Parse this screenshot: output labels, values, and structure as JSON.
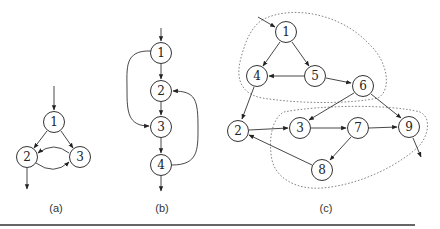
{
  "figure": {
    "captions": {
      "a": "(a)",
      "b": "(b)",
      "c": "(c)"
    },
    "graph_a": {
      "nodes": [
        {
          "id": "1",
          "label": "1",
          "x": 54,
          "y": 122
        },
        {
          "id": "2",
          "label": "2",
          "x": 27,
          "y": 157
        },
        {
          "id": "3",
          "label": "3",
          "x": 80,
          "y": 157
        }
      ],
      "edges": [
        {
          "from": "entry",
          "to": "1"
        },
        {
          "from": "1",
          "to": "2"
        },
        {
          "from": "1",
          "to": "3"
        },
        {
          "from": "2",
          "to": "3"
        },
        {
          "from": "3",
          "to": "2"
        },
        {
          "from": "2",
          "to": "exit"
        }
      ]
    },
    "graph_b": {
      "nodes": [
        {
          "id": "1",
          "label": "1",
          "x": 161,
          "y": 53
        },
        {
          "id": "2",
          "label": "2",
          "x": 161,
          "y": 91
        },
        {
          "id": "3",
          "label": "3",
          "x": 161,
          "y": 127
        },
        {
          "id": "4",
          "label": "4",
          "x": 161,
          "y": 165
        }
      ],
      "edges": [
        {
          "from": "entry",
          "to": "1"
        },
        {
          "from": "1",
          "to": "2"
        },
        {
          "from": "2",
          "to": "3"
        },
        {
          "from": "3",
          "to": "4"
        },
        {
          "from": "1",
          "to": "3"
        },
        {
          "from": "4",
          "to": "2"
        },
        {
          "from": "4",
          "to": "exit"
        }
      ]
    },
    "graph_c": {
      "nodes": [
        {
          "id": "1",
          "label": "1",
          "x": 286,
          "y": 32
        },
        {
          "id": "4",
          "label": "4",
          "x": 257,
          "y": 76
        },
        {
          "id": "5",
          "label": "5",
          "x": 315,
          "y": 76
        },
        {
          "id": "6",
          "label": "6",
          "x": 363,
          "y": 86
        },
        {
          "id": "2",
          "label": "2",
          "x": 238,
          "y": 131
        },
        {
          "id": "3",
          "label": "3",
          "x": 300,
          "y": 128
        },
        {
          "id": "7",
          "label": "7",
          "x": 358,
          "y": 128
        },
        {
          "id": "9",
          "label": "9",
          "x": 409,
          "y": 127
        },
        {
          "id": "8",
          "label": "8",
          "x": 322,
          "y": 170
        }
      ],
      "edges": [
        {
          "from": "entry",
          "to": "1"
        },
        {
          "from": "1",
          "to": "4"
        },
        {
          "from": "1",
          "to": "5"
        },
        {
          "from": "5",
          "to": "4"
        },
        {
          "from": "5",
          "to": "6"
        },
        {
          "from": "4",
          "to": "2"
        },
        {
          "from": "6",
          "to": "3"
        },
        {
          "from": "6",
          "to": "9"
        },
        {
          "from": "2",
          "to": "3"
        },
        {
          "from": "3",
          "to": "7"
        },
        {
          "from": "7",
          "to": "9"
        },
        {
          "from": "7",
          "to": "8"
        },
        {
          "from": "8",
          "to": "2"
        },
        {
          "from": "9",
          "to": "exit"
        }
      ],
      "regions": [
        {
          "name": "upper-region",
          "nodes": [
            "1",
            "4",
            "5",
            "6"
          ]
        },
        {
          "name": "lower-region",
          "nodes": [
            "3",
            "7",
            "8",
            "9"
          ]
        }
      ]
    }
  }
}
